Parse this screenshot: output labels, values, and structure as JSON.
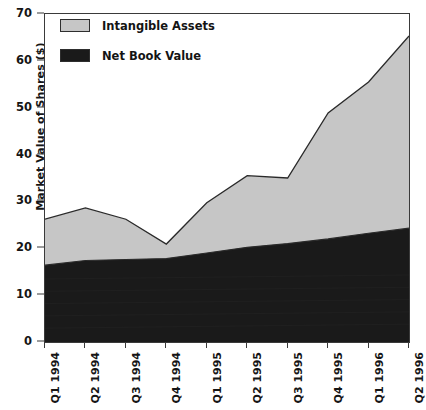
{
  "chart_data": {
    "type": "area",
    "stacked": true,
    "title": "",
    "xlabel": "",
    "ylabel": "Market Value of Shares ($)",
    "ylim": [
      0,
      70
    ],
    "yticks": [
      0,
      10,
      20,
      30,
      40,
      50,
      60,
      70
    ],
    "grid": false,
    "legend_position": "top-left",
    "categories": [
      "Q1 1994",
      "Q2 1994",
      "Q3 1994",
      "Q4 1994",
      "Q1 1995",
      "Q2 1995",
      "Q3 1995",
      "Q4 1995",
      "Q1 1996",
      "Q2 1996"
    ],
    "series": [
      {
        "name": "Net Book Value",
        "color": "#1a1a1a",
        "values": [
          16.4,
          17.4,
          17.6,
          17.8,
          19.0,
          20.2,
          21.0,
          22.0,
          23.2,
          24.3
        ]
      },
      {
        "name": "Intangible Assets",
        "color": "#c6c6c6",
        "values": [
          9.8,
          11.2,
          8.6,
          3.1,
          10.7,
          15.3,
          14.0,
          26.9,
          32.3,
          41.0
        ]
      }
    ],
    "totals": [
      26.2,
      28.6,
      26.2,
      20.9,
      29.7,
      35.5,
      35.0,
      48.9,
      55.5,
      65.3
    ]
  },
  "legend": {
    "items": [
      {
        "label": "Intangible Assets",
        "color": "#c6c6c6"
      },
      {
        "label": "Net Book Value",
        "color": "#1a1a1a"
      }
    ]
  },
  "axes": {
    "y_title": "Market Value of Shares ($)"
  },
  "colors": {
    "intangible": "#c6c6c6",
    "net_book": "#1a1a1a",
    "axis": "#3a3a3a",
    "background": "#ffffff"
  }
}
